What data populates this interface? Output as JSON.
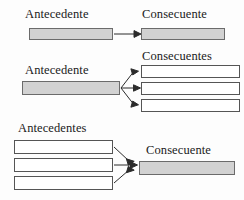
{
  "figure": {
    "background_color": "#fdfdfd",
    "box_fill_color": "#d2d2d2",
    "box_empty_color": "#ffffff",
    "border_color": "#4a4a4a",
    "arrow_color": "#2b2b2b"
  },
  "rows": [
    {
      "id": "one-to-one",
      "left_label": "Antecedente",
      "right_label": "Consecuente",
      "left_boxes": 1,
      "right_boxes": 1,
      "arrows": 1
    },
    {
      "id": "one-to-many",
      "left_label": "Antecedente",
      "right_label": "Consecuentes",
      "left_boxes": 1,
      "right_boxes": 3,
      "arrows": 3
    },
    {
      "id": "many-to-one",
      "left_label": "Antecedentes",
      "right_label": "Consecuente",
      "left_boxes": 3,
      "right_boxes": 1,
      "arrows": 3
    }
  ],
  "labels": {
    "row1_left": "Antecedente",
    "row1_right": "Consecuente",
    "row2_left": "Antecedente",
    "row2_right": "Consecuentes",
    "row3_left": "Antecedentes",
    "row3_right": "Consecuente"
  }
}
